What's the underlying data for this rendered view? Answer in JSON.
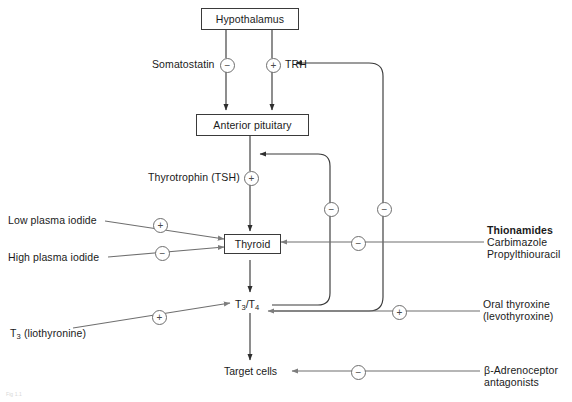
{
  "figure": {
    "caption": "Fig 1.1",
    "colors": {
      "line": "#3a3a3a",
      "line_light": "#8a8a8a",
      "text": "#1a1a1a",
      "box_border": "#3a3a3a",
      "sign_border": "#6e6e6e",
      "background": "#ffffff"
    }
  },
  "nodes": {
    "hypothalamus": {
      "label": "Hypothalamus",
      "type": "box"
    },
    "anterior_pituitary": {
      "label": "Anterior pituitary",
      "type": "box"
    },
    "thyroid": {
      "label": "Thyroid",
      "type": "box"
    },
    "t3t4": {
      "label_main": "T",
      "label_sub1": "3",
      "label_mid": "/T",
      "label_sub2": "4",
      "type": "plain"
    },
    "target_cells": {
      "label": "Target cells",
      "type": "plain"
    }
  },
  "mediators": {
    "somatostatin": {
      "label": "Somatostatin",
      "sign": "−"
    },
    "trh": {
      "label": "TRH",
      "sign": "+"
    },
    "tsh": {
      "label": "Thyrotrophin (TSH)",
      "sign": "+"
    }
  },
  "inputs": {
    "low_plasma_iodide": {
      "label": "Low plasma iodide",
      "sign": "+"
    },
    "high_plasma_iodide": {
      "label": "High plasma iodide",
      "sign": "−"
    },
    "t3_liothyronine": {
      "label_main": "T",
      "label_sub": "3",
      "label_rest": " (liothyronine)",
      "sign": "+"
    }
  },
  "drugs": {
    "thionamides": {
      "heading": "Thionamides",
      "items": [
        "Carbimazole",
        "Propylthiouracil"
      ],
      "sign": "−"
    },
    "oral_thyroxine": {
      "line1": "Oral thyroxine",
      "line2": "(levothyroxine)",
      "sign": "+"
    },
    "beta_antagonists": {
      "line1": "β-Adrenoceptor",
      "line2": "antagonists",
      "sign": "−"
    }
  },
  "feedback": {
    "to_hypothalamus": {
      "sign": "−",
      "description": "negative feedback to TRH"
    },
    "to_pituitary": {
      "sign": "−",
      "description": "negative feedback to anterior pituitary"
    }
  }
}
